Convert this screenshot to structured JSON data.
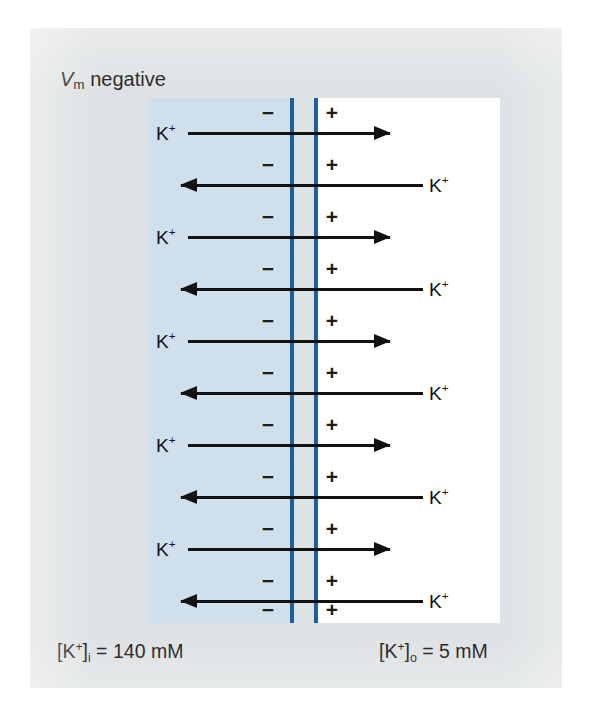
{
  "figure": {
    "title_annotation": "V_m negative",
    "membrane_potential_label": {
      "symbol": "V",
      "subscript": "m",
      "state": "negative"
    },
    "compartments": {
      "inside": {
        "name": "intracellular",
        "color": "#cfdfec",
        "charge_symbol": "−",
        "concentration_label": {
          "species": "K",
          "charge": "+",
          "location_subscript": "i",
          "equals": " = ",
          "value": "140 mM",
          "full_text": "[K+]i = 140 mM"
        }
      },
      "outside": {
        "name": "extracellular",
        "color": "#ffffff",
        "charge_symbol": "+",
        "concentration_label": {
          "species": "K",
          "charge": "+",
          "location_subscript": "o",
          "equals": " = ",
          "value": "5 mM",
          "full_text": "[K+]o = 5 mM"
        }
      }
    },
    "membrane": {
      "color": "#1d5f9e",
      "leaflet_count": 2
    },
    "ion_label_text": "K",
    "ion_label_charge": "+",
    "charge_rows": [
      {
        "neg": "−",
        "pos": "+",
        "y": 14
      },
      {
        "neg": "−",
        "pos": "+",
        "y": 66
      },
      {
        "neg": "−",
        "pos": "+",
        "y": 118
      },
      {
        "neg": "−",
        "pos": "+",
        "y": 170
      },
      {
        "neg": "−",
        "pos": "+",
        "y": 222
      },
      {
        "neg": "−",
        "pos": "+",
        "y": 274
      },
      {
        "neg": "−",
        "pos": "+",
        "y": 326
      },
      {
        "neg": "−",
        "pos": "+",
        "y": 378
      },
      {
        "neg": "−",
        "pos": "+",
        "y": 430
      },
      {
        "neg": "−",
        "pos": "+",
        "y": 482
      },
      {
        "neg": "−",
        "pos": "+",
        "y": 511
      }
    ],
    "flux_arrows": [
      {
        "direction": "efflux",
        "y": 35,
        "label_side": "left",
        "label": "K+"
      },
      {
        "direction": "influx",
        "y": 87,
        "label_side": "right",
        "label": "K+"
      },
      {
        "direction": "efflux",
        "y": 139,
        "label_side": "left",
        "label": "K+"
      },
      {
        "direction": "influx",
        "y": 191,
        "label_side": "right",
        "label": "K+"
      },
      {
        "direction": "efflux",
        "y": 243,
        "label_side": "left",
        "label": "K+"
      },
      {
        "direction": "influx",
        "y": 295,
        "label_side": "right",
        "label": "K+"
      },
      {
        "direction": "efflux",
        "y": 347,
        "label_side": "left",
        "label": "K+"
      },
      {
        "direction": "influx",
        "y": 399,
        "label_side": "right",
        "label": "K+"
      },
      {
        "direction": "efflux",
        "y": 451,
        "label_side": "left",
        "label": "K+"
      },
      {
        "direction": "influx",
        "y": 503,
        "label_side": "right",
        "label": "K+"
      }
    ]
  }
}
